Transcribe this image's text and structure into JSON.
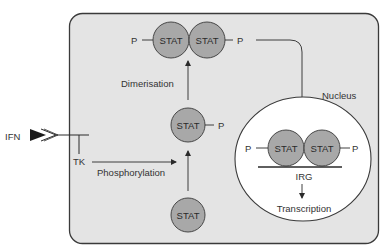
{
  "diagram": {
    "colors": {
      "cell_fill": "#e4e4e4",
      "cell_stroke": "#3a3a3a",
      "nucleus_fill": "#ffffff",
      "stat_fill": "#a8a8a8",
      "line": "#2a2a2a",
      "text": "#333333"
    },
    "labels": {
      "ifn": "IFN",
      "tk": "TK",
      "phosphorylation": "Phosphorylation",
      "dimerisation": "Dimerisation",
      "nucleus": "Nucleus",
      "irg": "IRG",
      "transcription": "Transcription",
      "stat": "STAT",
      "p": "P"
    },
    "nodes": [
      {
        "id": "stat-unphosphorylated",
        "label": "STAT"
      },
      {
        "id": "stat-phosphorylated",
        "label": "STAT",
        "phospho": "P"
      },
      {
        "id": "stat-dimer-cytoplasm",
        "labels": [
          "STAT",
          "STAT"
        ],
        "phospho": [
          "P",
          "P"
        ]
      },
      {
        "id": "stat-dimer-nucleus",
        "labels": [
          "STAT",
          "STAT"
        ],
        "phospho": [
          "P",
          "P"
        ],
        "bound_to": "IRG"
      }
    ],
    "edges": [
      {
        "from": "IFN",
        "to": "receptor"
      },
      {
        "from": "TK",
        "to": "stat-phosphorylated",
        "label": "Phosphorylation"
      },
      {
        "from": "stat-unphosphorylated",
        "to": "stat-phosphorylated"
      },
      {
        "from": "stat-phosphorylated",
        "to": "stat-dimer-cytoplasm",
        "label": "Dimerisation"
      },
      {
        "from": "stat-dimer-cytoplasm",
        "to": "stat-dimer-nucleus"
      },
      {
        "from": "IRG",
        "to": "Transcription"
      }
    ]
  }
}
